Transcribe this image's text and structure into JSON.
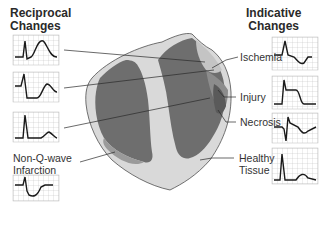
{
  "headings": {
    "left_line1": "Reciprocal",
    "left_line2": "Changes",
    "right_line1": "Indicative",
    "right_line2": "Changes"
  },
  "labels": {
    "ischemia": "Ischemia",
    "injury": "Injury",
    "necrosis": "Necrosis",
    "healthy_line1": "Healthy",
    "healthy_line2": "Tissue",
    "nonq_line1": "Non-Q-wave",
    "nonq_line2": "Infarction"
  },
  "colors": {
    "healthy_tissue": "#d9d9d9",
    "chamber_dark": "#6e6e6e",
    "necrosis_zone": "#5a5a5a",
    "injury_zone": "#8c8c8c",
    "ischemia_zone": "#c4c4c4",
    "outline": "#3a3a3a",
    "grid": "#bdbdbd",
    "trace": "#1a1a1a"
  },
  "ecg_panels": {
    "reciprocal": [
      {
        "id": "reciprocal-ischemia",
        "pattern": "tall peaked T wave"
      },
      {
        "id": "reciprocal-injury",
        "pattern": "ST depression"
      },
      {
        "id": "reciprocal-necrosis",
        "pattern": "tall R with upright T"
      },
      {
        "id": "non-q-wave-infarction",
        "pattern": "ST depression / T inversion"
      }
    ],
    "indicative": [
      {
        "id": "indicative-ischemia",
        "pattern": "T wave inversion"
      },
      {
        "id": "indicative-injury",
        "pattern": "ST elevation"
      },
      {
        "id": "indicative-necrosis",
        "pattern": "pathologic Q wave with inverted T"
      },
      {
        "id": "indicative-healthy",
        "pattern": "normal QRS and T"
      }
    ]
  }
}
